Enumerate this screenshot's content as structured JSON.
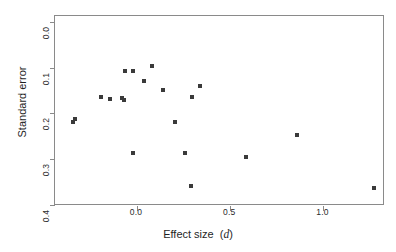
{
  "chart_data": {
    "type": "scatter",
    "title": "",
    "xlabel": "Effect size  (d)",
    "xlabel_plain": "Effect size",
    "xlabel_symbol": "d",
    "ylabel": "Standard error",
    "xlim": [
      -0.44,
      1.33
    ],
    "ylim": [
      0.403,
      -0.013
    ],
    "y_inverted": true,
    "grid": false,
    "legend": null,
    "xticks": [
      0.0,
      0.5,
      1.0
    ],
    "xtick_labels": [
      "0.0",
      "0.5",
      "1.0"
    ],
    "yticks": [
      0.0,
      0.1,
      0.2,
      0.3,
      0.4
    ],
    "ytick_labels": [
      "0.0",
      "0.1",
      "0.2",
      "0.3",
      "0.4"
    ],
    "point_color": "#3a3a3a",
    "axis_color": "#8a8a8a",
    "background": "#ffffff",
    "n_points": 20,
    "points": [
      {
        "x": -0.344,
        "y": 0.22
      },
      {
        "x": -0.333,
        "y": 0.212
      },
      {
        "x": -0.194,
        "y": 0.165
      },
      {
        "x": -0.145,
        "y": 0.169
      },
      {
        "x": -0.081,
        "y": 0.167
      },
      {
        "x": -0.07,
        "y": 0.171
      },
      {
        "x": -0.065,
        "y": 0.108
      },
      {
        "x": -0.022,
        "y": 0.108
      },
      {
        "x": -0.022,
        "y": 0.286
      },
      {
        "x": 0.038,
        "y": 0.129
      },
      {
        "x": 0.081,
        "y": 0.097
      },
      {
        "x": 0.14,
        "y": 0.15
      },
      {
        "x": 0.204,
        "y": 0.22
      },
      {
        "x": 0.258,
        "y": 0.286
      },
      {
        "x": 0.29,
        "y": 0.36
      },
      {
        "x": 0.296,
        "y": 0.165
      },
      {
        "x": 0.339,
        "y": 0.14
      },
      {
        "x": 0.586,
        "y": 0.296
      },
      {
        "x": 0.86,
        "y": 0.248
      },
      {
        "x": 1.269,
        "y": 0.364
      }
    ]
  }
}
